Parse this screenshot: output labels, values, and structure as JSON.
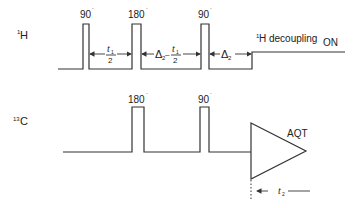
{
  "diagram": {
    "title": "",
    "channels": [
      {
        "id": "1H",
        "mass": "1",
        "nucleus": "H"
      },
      {
        "id": "13C",
        "mass": "13",
        "nucleus": "C"
      }
    ],
    "h_pulses": [
      {
        "label": "90",
        "deg": "˙"
      },
      {
        "label": "180",
        "deg": "˙"
      },
      {
        "label": "90",
        "deg": "˙"
      }
    ],
    "c_pulses": [
      {
        "label": "180",
        "deg": "˙"
      },
      {
        "label": "90",
        "deg": "˙"
      }
    ],
    "delays": {
      "t1_half_num": "t",
      "t1_sub": "1",
      "t1_den": "2",
      "delta": "Δ",
      "delta_sub": "2",
      "minus": "–"
    },
    "decoupling": {
      "sup": "1",
      "text": "H decoupling",
      "state": "ON"
    },
    "acquisition": {
      "label": "AQT",
      "t2": "t",
      "t2_sub": "2"
    },
    "colors": {
      "ink": "#333333",
      "background": "#ffffff"
    }
  }
}
